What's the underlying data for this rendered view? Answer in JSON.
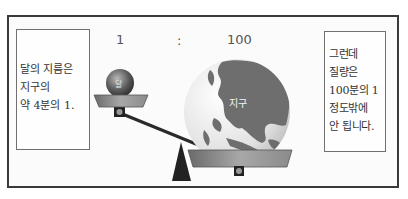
{
  "diagram": {
    "ratio": {
      "left": "1",
      "separator": ":",
      "right": "100"
    },
    "moon": {
      "label": "달"
    },
    "earth": {
      "label": "지구"
    },
    "left_note": {
      "lines": [
        "달의 지름은",
        "지구의",
        "약 4분의 1."
      ]
    },
    "right_note": {
      "lines": [
        "그런데",
        "질량은",
        "100분의 1",
        "정도밖에",
        "안 됩니다."
      ]
    },
    "colors": {
      "frame": "#3a3a3a",
      "beam": "#2a2a2a",
      "pan": "#8a8a8a",
      "ocean": "#e0e0e0",
      "land": "#6e6e6e"
    }
  }
}
